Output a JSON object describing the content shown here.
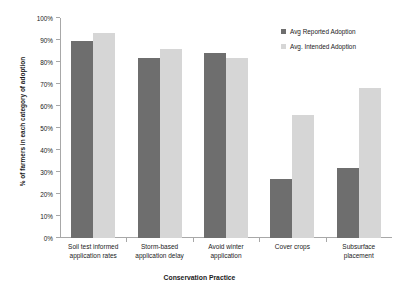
{
  "chart_data": {
    "type": "bar",
    "title": "",
    "xlabel": "Conservation Practice",
    "ylabel": "% of farmers in each category of adoption",
    "categories": [
      "Soil test informed application rates",
      "Storm-based application delay",
      "Avoid winter application",
      "Cover crops",
      "Subsurface placement"
    ],
    "category_lines": [
      [
        "Soil test informed",
        "application rates"
      ],
      [
        "Storm-based",
        "application delay"
      ],
      [
        "Avoid winter",
        "application"
      ],
      [
        "Cover crops",
        ""
      ],
      [
        "Subsurface",
        "placement"
      ]
    ],
    "series": [
      {
        "name": "Avg Reported Adoption",
        "color": "#6e6e6e",
        "values": [
          89.5,
          82,
          84,
          27,
          32
        ]
      },
      {
        "name": "Avg. Intended Adoption",
        "color": "#d6d6d6",
        "values": [
          93,
          86,
          82,
          56,
          68
        ]
      }
    ],
    "ylim": [
      0,
      100
    ],
    "ytick_values": [
      0,
      10,
      20,
      30,
      40,
      50,
      60,
      70,
      80,
      90,
      100
    ],
    "ytick_labels": [
      "0%",
      "10%",
      "20%",
      "30%",
      "40%",
      "50%",
      "60%",
      "70%",
      "80%",
      "90%",
      "100%"
    ],
    "grid": false,
    "legend_position": "top-right"
  }
}
